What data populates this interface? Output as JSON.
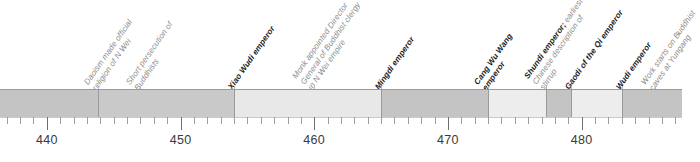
{
  "chart_data": {
    "type": "table",
    "title": "",
    "xlabel": "Year (CE)",
    "ylabel": "",
    "xlim": [
      436.5,
      487.5
    ],
    "grid": false,
    "legend": "none",
    "axis": {
      "major_ticks": [
        440,
        450,
        460,
        470,
        480
      ],
      "major_tick_labels": [
        "440",
        "450",
        "460",
        "470",
        "480"
      ],
      "minor_tick_interval": 1,
      "minor_tick_range": [
        437,
        487
      ]
    },
    "segments": [
      {
        "start": 436.5,
        "end": 443.8,
        "color": "#c4c4c4"
      },
      {
        "start": 443.8,
        "end": 454.0,
        "color": "#c9c9c9"
      },
      {
        "start": 454.0,
        "end": 465.0,
        "color": "#e8e8e8"
      },
      {
        "start": 465.0,
        "end": 473.0,
        "color": "#c4c4c4"
      },
      {
        "start": 473.0,
        "end": 477.3,
        "color": "#ededed"
      },
      {
        "start": 477.3,
        "end": 479.2,
        "color": "#c4c4c4"
      },
      {
        "start": 479.2,
        "end": 483.0,
        "color": "#ededed"
      },
      {
        "start": 483.0,
        "end": 487.5,
        "color": "#c4c4c4"
      }
    ],
    "annotations": [
      {
        "year": 443.8,
        "kind": "event",
        "lines": [
          "Daoism made official",
          "religion of N Wei"
        ]
      },
      {
        "year": 447.0,
        "kind": "event",
        "lines": [
          "Short persecution of",
          "Buddhists"
        ]
      },
      {
        "year": 454.0,
        "kind": "reign",
        "lines": [
          "Xiao Wudi emperor"
        ]
      },
      {
        "year": 460.0,
        "kind": "event",
        "lines": [
          "Monk appointed Director",
          "General of Buddhist clergy",
          "in N Wei empire"
        ]
      },
      {
        "year": 465.0,
        "kind": "reign",
        "lines": [
          "Mingdi emperor"
        ]
      },
      {
        "year": 473.0,
        "kind": "reign",
        "lines": [
          "Cang Wu Wang",
          "emperor"
        ]
      },
      {
        "year": 477.3,
        "kind": "mixed",
        "head": "Shundi emperor;",
        "lines": [
          " earliest",
          "Chinese description of",
          "stirrup"
        ]
      },
      {
        "year": 479.2,
        "kind": "reign",
        "lines": [
          "Gaodi of the Qi emperor"
        ]
      },
      {
        "year": 483.0,
        "kind": "reign",
        "lines": [
          "Wudi emperor"
        ]
      },
      {
        "year": 485.5,
        "kind": "event",
        "lines": [
          "Work starts on Buddhist",
          "caves at Yungang"
        ]
      }
    ]
  },
  "colors": {
    "segment_dark": "#c4c4c4",
    "segment_light": "#ededed",
    "reign_text": "#1a1a1a",
    "event_text": "#8d8d8d",
    "axis_text": "#3a3a3a",
    "rule": "#9a9a9a"
  }
}
